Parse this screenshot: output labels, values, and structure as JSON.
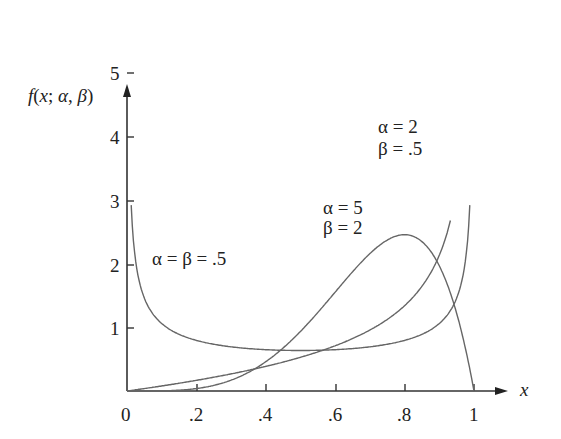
{
  "chart_data": {
    "type": "line",
    "title": "",
    "ylabel": "f(x; α, β)",
    "xlabel": "x",
    "xlim": [
      0,
      1
    ],
    "ylim": [
      0,
      5
    ],
    "x_ticks": [
      "0",
      ".2",
      ".4",
      ".6",
      ".8",
      "1"
    ],
    "y_ticks": [
      "1",
      "2",
      "3",
      "4",
      "5"
    ],
    "grid": false,
    "series": [
      {
        "name": "α = β = .5",
        "alpha": 0.5,
        "beta": 0.5,
        "x": [
          0.01,
          0.05,
          0.1,
          0.2,
          0.4,
          0.5,
          0.6,
          0.8,
          0.9,
          0.95,
          0.99
        ],
        "values": [
          3.2,
          1.46,
          1.06,
          0.8,
          0.65,
          0.64,
          0.65,
          0.8,
          1.06,
          1.46,
          3.2
        ]
      },
      {
        "name": "α = 5, β = 2",
        "alpha": 5,
        "beta": 2,
        "x": [
          0,
          0.2,
          0.4,
          0.6,
          0.7,
          0.8,
          0.9,
          0.95,
          1.0
        ],
        "values": [
          0,
          0.05,
          0.46,
          1.56,
          2.16,
          2.46,
          1.97,
          1.22,
          0
        ]
      },
      {
        "name": "α = 2, β = .5",
        "alpha": 2,
        "beta": 0.5,
        "x": [
          0,
          0.2,
          0.4,
          0.6,
          0.8,
          0.9,
          0.93
        ],
        "values": [
          0,
          0.17,
          0.39,
          0.71,
          1.34,
          2.13,
          2.83
        ]
      }
    ],
    "annotations": [
      {
        "text_lines": [
          "α = β = .5"
        ],
        "x": 0.08,
        "y": 2.1
      },
      {
        "text_lines": [
          "α = 5",
          "β = 2"
        ],
        "x": 0.56,
        "y": 2.65
      },
      {
        "text_lines": [
          "α = 2",
          "β = .5"
        ],
        "x": 0.78,
        "y": 3.9
      }
    ]
  },
  "labels": {
    "ylabel": "f(x; α, β)",
    "xlabel": "x",
    "xt0": "0",
    "xt1": ".2",
    "xt2": ".4",
    "xt3": ".6",
    "xt4": ".8",
    "xt5": "1",
    "yt1": "1",
    "yt2": "2",
    "yt3": "3",
    "yt4": "4",
    "yt5": "5",
    "a1": "α = β = .5",
    "a2l1": "α = 5",
    "a2l2": "β = 2",
    "a3l1": "α = 2",
    "a3l2": "β = .5"
  }
}
